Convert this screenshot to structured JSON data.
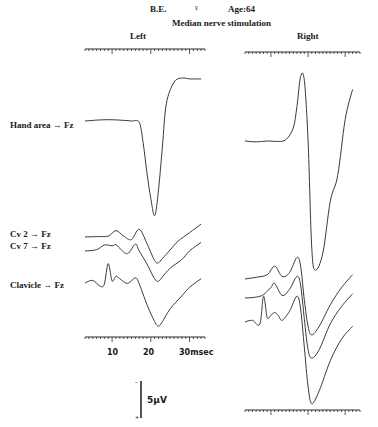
{
  "header": {
    "subject": "B.E.",
    "sex_symbol": "♀",
    "age_label": "Age:64",
    "title": "Median nerve stimulation"
  },
  "panels": {
    "left": {
      "label": "Left"
    },
    "right": {
      "label": "Right"
    }
  },
  "trace_labels": [
    {
      "id": "hand",
      "label": "Hand area → Fz"
    },
    {
      "id": "cv2",
      "label": "Cv 2 → Fz"
    },
    {
      "id": "cv7",
      "label": "Cv 7 → Fz"
    },
    {
      "id": "clavicle",
      "label": "Clavicle → Fz"
    }
  ],
  "time_axis": {
    "tick_labels": [
      "10",
      "20",
      "30msec"
    ]
  },
  "scale_bar": {
    "label": "5μV",
    "minus": "-",
    "plus": "+"
  },
  "colors": {
    "trace": "#3a3a3a",
    "axis": "#2a2a2a",
    "background": "#ffffff"
  },
  "chart_data": {
    "type": "line",
    "xlabel": "msec",
    "ylabel": "μV (5μV scale bar, negative up)",
    "x_ticks": [
      10,
      20,
      30
    ],
    "xlim": [
      3,
      34
    ],
    "grid": false,
    "legend": [
      "Hand area → Fz",
      "Cv 2 → Fz",
      "Cv 7 → Fz",
      "Clavicle → Fz"
    ],
    "panels": [
      {
        "name": "Left",
        "series": [
          {
            "name": "Hand area → Fz",
            "x": [
              3,
              6,
              9,
              12,
              15,
              17,
              18,
              19,
              20,
              21,
              22,
              23,
              24,
              26,
              28,
              30,
              33
            ],
            "y": [
              0,
              0.2,
              0.3,
              0.2,
              0,
              -0.3,
              -5,
              -12,
              -18,
              -22,
              -16,
              -6,
              4,
              9,
              10,
              9.8,
              9.8
            ]
          },
          {
            "name": "Cv 2 → Fz",
            "x": [
              3,
              6,
              9,
              11,
              13,
              15,
              17,
              19,
              21,
              22,
              23,
              25,
              27,
              30,
              33
            ],
            "y": [
              0,
              0.1,
              0.2,
              1.5,
              0.2,
              -0.6,
              1.8,
              -1.5,
              -5.5,
              -6,
              -5,
              -3,
              -1,
              1,
              3
            ]
          },
          {
            "name": "Cv 7 → Fz",
            "x": [
              3,
              6,
              8,
              10,
              11,
              12,
              14,
              16,
              17,
              19,
              21,
              22,
              23,
              25,
              28,
              30,
              33
            ],
            "y": [
              0,
              0.3,
              1.4,
              1.2,
              1.5,
              0.6,
              -0.6,
              1.6,
              0,
              -3,
              -6.5,
              -7,
              -6,
              -4,
              -2,
              0,
              2
            ]
          },
          {
            "name": "Clavicle → Fz",
            "x": [
              3,
              5,
              7,
              8,
              9,
              10,
              11,
              12,
              14,
              16,
              17,
              19,
              21,
              22,
              23,
              25,
              28,
              30,
              33
            ],
            "y": [
              0,
              0.6,
              -0.8,
              -0.2,
              4.5,
              0.5,
              1.6,
              1,
              -0.1,
              1.2,
              -0.2,
              -5,
              -9,
              -10,
              -9,
              -6,
              -3,
              -1,
              1
            ]
          }
        ]
      },
      {
        "name": "Right",
        "series": [
          {
            "name": "Hand area → Fz",
            "x": [
              3,
              6,
              9,
              12,
              14,
              16,
              17,
              18,
              19,
              20,
              21,
              22,
              24,
              26,
              28,
              30,
              32
            ],
            "y": [
              0,
              -0.2,
              0,
              -0.1,
              0.3,
              3,
              8,
              15,
              14,
              0,
              -25,
              -30,
              -26,
              -14,
              -8,
              5,
              12
            ]
          },
          {
            "name": "Cv 2 → Fz",
            "x": [
              3,
              6,
              9,
              11,
              13,
              15,
              17,
              18,
              19,
              20,
              21,
              23,
              26,
              29,
              32
            ],
            "y": [
              0,
              0.4,
              1,
              3,
              0.6,
              1.5,
              5,
              3,
              -5,
              -11,
              -13,
              -11,
              -6,
              -2,
              1
            ]
          },
          {
            "name": "Cv 7 → Fz",
            "x": [
              3,
              6,
              8,
              10,
              11,
              13,
              15,
              17,
              18,
              19,
              20,
              21,
              23,
              26,
              29,
              32
            ],
            "y": [
              0,
              0.2,
              0.8,
              2.5,
              3.4,
              0.6,
              2,
              5,
              3,
              -5,
              -12,
              -14,
              -12,
              -6,
              -2,
              1
            ]
          },
          {
            "name": "Clavicle → Fz",
            "x": [
              3,
              5,
              7,
              8,
              9,
              10,
              11,
              12,
              13,
              15,
              17,
              18,
              19,
              20,
              21,
              23,
              26,
              29,
              32
            ],
            "y": [
              0,
              0.4,
              -0.5,
              6,
              1,
              1.6,
              2.2,
              1.5,
              0.4,
              2.5,
              6,
              3,
              -6,
              -15,
              -19,
              -16,
              -9,
              -4,
              -1
            ]
          }
        ]
      }
    ]
  }
}
